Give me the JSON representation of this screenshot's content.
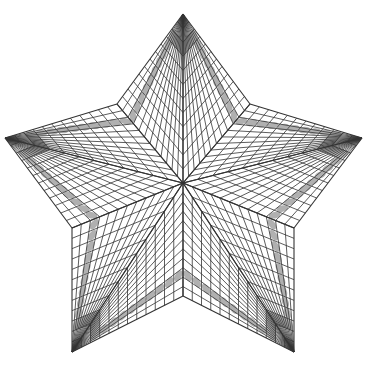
{
  "diagram": {
    "title": "",
    "type": "star-grid-pattern",
    "background": "#ffffff",
    "line_color": "#333333",
    "band_color": "#b0b0b0",
    "grid_divisions": 12,
    "band_index": 2,
    "center": [
      183,
      183
    ],
    "outer_points": [
      [
        183,
        14
      ],
      [
        362,
        138
      ],
      [
        294,
        352
      ],
      [
        72,
        352
      ],
      [
        5,
        138
      ]
    ],
    "inner_points": [
      [
        250,
        104
      ],
      [
        294,
        228
      ],
      [
        183,
        296
      ],
      [
        72,
        228
      ],
      [
        117,
        104
      ]
    ]
  }
}
